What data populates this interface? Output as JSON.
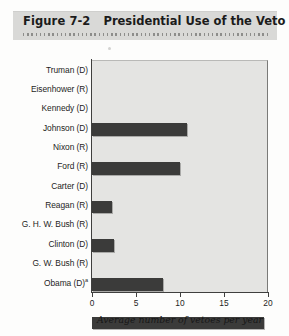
{
  "figure": {
    "number": "Figure 7-2",
    "title": "Presidential Use of the Veto"
  },
  "chart_data": {
    "type": "bar",
    "orientation": "horizontal",
    "title": "Presidential Use of the Veto",
    "xlabel": "Average number of vetoes per year",
    "ylabel": "",
    "xlim": [
      0,
      20
    ],
    "xticks": [
      0,
      5,
      10,
      15,
      20
    ],
    "xtick_labels": [
      "0",
      "5",
      "10",
      "15",
      "20"
    ],
    "grid": false,
    "legend": null,
    "bar_color": "#3b3b3a",
    "plot_background": "#e4e4e2",
    "categories": [
      "Truman (D)",
      "Eisenhower (R)",
      "Kennedy (D)",
      "Johnson (D)",
      "Nixon (R)",
      "Ford (R)",
      "Carter (D)",
      "Reagan (R)",
      "G. H. W. Bush (R)",
      "Clinton (D)",
      "G. W. Bush (R)",
      "Obama (D)"
    ],
    "category_footnotes": [
      "",
      "",
      "",
      "",
      "",
      "",
      "",
      "",
      "",
      "",
      "",
      "a"
    ],
    "values": [
      10.8,
      10.0,
      2.3,
      2.5,
      8.1,
      19.6,
      7.0,
      8.6,
      11.2,
      2.7,
      0.5,
      0.5
    ]
  },
  "axis": {
    "x_title": "Average number of vetoes per year"
  }
}
